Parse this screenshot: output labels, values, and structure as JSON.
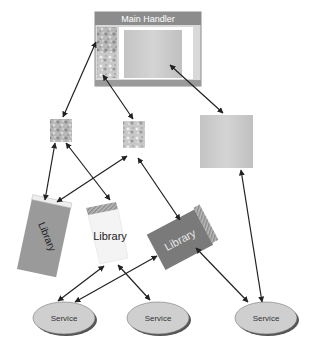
{
  "diagram": {
    "main_handler": {
      "title": "Main Handler"
    },
    "libraries": [
      {
        "label": "Library",
        "style": "gray-tilted-left"
      },
      {
        "label": "Library",
        "style": "white-upright"
      },
      {
        "label": "Library",
        "style": "dark-tilted-right"
      }
    ],
    "services": [
      {
        "label": "Service"
      },
      {
        "label": "Service"
      },
      {
        "label": "Service"
      }
    ],
    "colors": {
      "handler_frame": "#8c8c8c",
      "handler_bg": "#d6d6d6",
      "panel": "#c8c8c8",
      "library_gray": "#9a9a9a",
      "library_dark": "#7a7a7a",
      "library_white": "#f4f4f4",
      "service_fill": "#cfcfcf",
      "arrow": "#222222"
    }
  }
}
